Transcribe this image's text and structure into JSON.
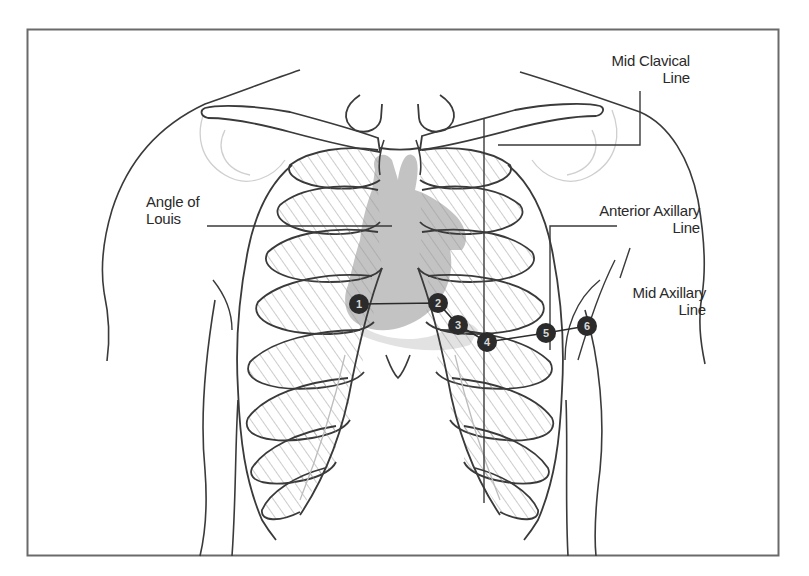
{
  "diagram": {
    "colors": {
      "outline": "#3a3a3a",
      "faint_outline": "#c8c8c8",
      "heart_fill": "#bdbdbd",
      "electrode_fill": "#2b2b2b",
      "frame": "#6a6a6a",
      "background": "#ffffff"
    },
    "labels": {
      "mid_clavical": {
        "line1": "Mid Clavical",
        "line2": "Line"
      },
      "angle_of_louis": {
        "line1": "Angle of",
        "line2": "Louis"
      },
      "anterior_axillary": {
        "line1": "Anterior Axillary",
        "line2": "Line"
      },
      "mid_axillary": {
        "line1": "Mid Axillary",
        "line2": "Line"
      }
    },
    "electrodes": [
      {
        "id": "1",
        "label": "1",
        "cx": 359,
        "cy": 304
      },
      {
        "id": "2",
        "label": "2",
        "cx": 438,
        "cy": 303
      },
      {
        "id": "3",
        "label": "3",
        "cx": 458,
        "cy": 325
      },
      {
        "id": "4",
        "label": "4",
        "cx": 487,
        "cy": 342
      },
      {
        "id": "5",
        "label": "5",
        "cx": 546,
        "cy": 333
      },
      {
        "id": "6",
        "label": "6",
        "cx": 587,
        "cy": 326
      }
    ]
  }
}
